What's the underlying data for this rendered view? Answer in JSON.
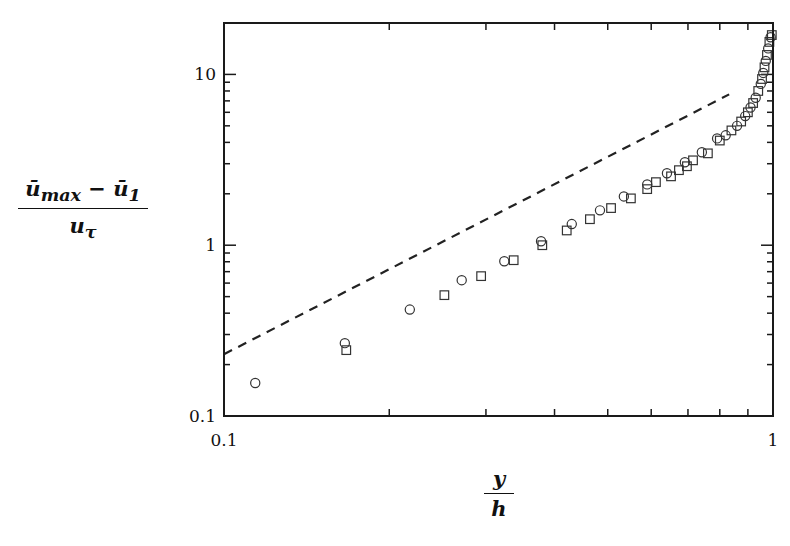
{
  "chart_data": {
    "type": "scatter",
    "title": "",
    "xlabel": "y/h",
    "ylabel": "(ū_max − ū_1) / u_τ",
    "xlabel_parts": {
      "numerator": "y",
      "denominator": "h"
    },
    "ylabel_parts": {
      "numerator": "ū",
      "numerator_sub": "max",
      "minus": " − ū",
      "minus_sub": "1",
      "denominator": "u",
      "denominator_sub": "τ"
    },
    "xscale": "log",
    "yscale": "log",
    "xlim": [
      0.1,
      1.0
    ],
    "ylim": [
      0.1,
      20
    ],
    "xticks": [
      {
        "value": 0.1,
        "label": "0.1"
      },
      {
        "value": 1,
        "label": "1"
      }
    ],
    "yticks": [
      {
        "value": 0.1,
        "label": "0.1"
      },
      {
        "value": 1,
        "label": "1"
      },
      {
        "value": 10,
        "label": "10"
      }
    ],
    "grid": false,
    "legend": null,
    "series": [
      {
        "name": "circles",
        "marker": "circle",
        "x": [
          0.114,
          0.166,
          0.218,
          0.271,
          0.324,
          0.378,
          0.43,
          0.484,
          0.535,
          0.59,
          0.641,
          0.691,
          0.742,
          0.791,
          0.82,
          0.86,
          0.89,
          0.91,
          0.93,
          0.95,
          0.96,
          0.97,
          0.98,
          0.99
        ],
        "y": [
          0.156,
          0.267,
          0.42,
          0.624,
          0.806,
          1.055,
          1.33,
          1.6,
          1.93,
          2.27,
          2.64,
          3.06,
          3.5,
          4.22,
          4.4,
          5.0,
          5.7,
          6.4,
          7.3,
          8.8,
          10.2,
          12.0,
          14.2,
          16.5
        ]
      },
      {
        "name": "squares",
        "marker": "square",
        "x": [
          0.167,
          0.252,
          0.294,
          0.337,
          0.38,
          0.421,
          0.464,
          0.507,
          0.551,
          0.59,
          0.612,
          0.652,
          0.674,
          0.697,
          0.715,
          0.761,
          0.8,
          0.84,
          0.875,
          0.9,
          0.92,
          0.94,
          0.955,
          0.965,
          0.975,
          0.985,
          0.995
        ],
        "y": [
          0.243,
          0.51,
          0.659,
          0.817,
          1.0,
          1.22,
          1.42,
          1.65,
          1.88,
          2.13,
          2.34,
          2.53,
          2.75,
          2.9,
          3.14,
          3.45,
          4.1,
          4.7,
          5.3,
          6.0,
          6.8,
          8.0,
          9.4,
          11.0,
          13.0,
          15.5,
          17.0
        ]
      },
      {
        "name": "dashed-line",
        "marker": "none",
        "line_style": "dashed",
        "x": [
          0.1,
          0.832
        ],
        "y": [
          0.23,
          7.64
        ]
      }
    ]
  },
  "layout": {
    "plot_left": 224,
    "plot_right": 773,
    "plot_top": 23,
    "plot_bottom": 416,
    "colors": {
      "axis": "#1a1a1a",
      "marker": "#333333",
      "line": "#222222",
      "background": "#ffffff"
    }
  }
}
